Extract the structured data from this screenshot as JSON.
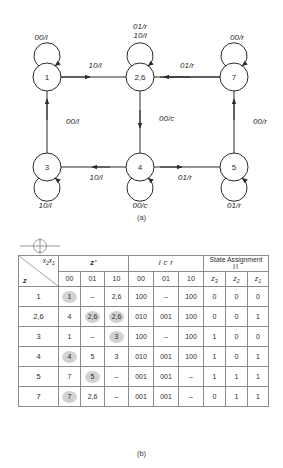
{
  "figure_a": {
    "caption": "(a)",
    "states": [
      {
        "id": "s1",
        "label": "1"
      },
      {
        "id": "s26",
        "label": "2,6"
      },
      {
        "id": "s7",
        "label": "7"
      },
      {
        "id": "s3",
        "label": "3"
      },
      {
        "id": "s4",
        "label": "4"
      },
      {
        "id": "s5",
        "label": "5"
      }
    ],
    "self_loops": [
      {
        "state": "1",
        "label": "00/l",
        "position": "top"
      },
      {
        "state": "2,6",
        "label_line1": "01/r",
        "label_line2": "10/l",
        "position": "top"
      },
      {
        "state": "7",
        "label": "00/r",
        "position": "top"
      },
      {
        "state": "3",
        "label": "10/l",
        "position": "bottom"
      },
      {
        "state": "4",
        "label": "00/c",
        "position": "bottom"
      },
      {
        "state": "5",
        "label": "01/r",
        "position": "bottom"
      }
    ],
    "transitions": [
      {
        "from": "1",
        "to": "2,6",
        "label": "10/l",
        "direction": "right"
      },
      {
        "from": "7",
        "to": "2,6",
        "label": "01/r",
        "direction": "left"
      },
      {
        "from": "3",
        "to": "1",
        "label": "00/l",
        "direction": "up"
      },
      {
        "from": "2,6",
        "to": "4",
        "label": "00/c",
        "direction": "down"
      },
      {
        "from": "5",
        "to": "7",
        "label": "00/r",
        "direction": "up"
      },
      {
        "from": "4",
        "to": "3",
        "label": "10/l",
        "direction": "left"
      },
      {
        "from": "4",
        "to": "5",
        "label": "01/r",
        "direction": "right"
      }
    ]
  },
  "figure_b": {
    "caption": "(b)",
    "corner": {
      "col_var": "x2x1",
      "row_var": "z"
    },
    "group_headers": [
      {
        "label": "z'",
        "span": 3,
        "italic": true
      },
      {
        "label": "l c r",
        "span": 3,
        "italic": true
      },
      {
        "label": "State Assignment",
        "sub": "II",
        "span": 3,
        "italic": false
      }
    ],
    "sub_headers": [
      "00",
      "01",
      "10",
      "00",
      "01",
      "10",
      "z3",
      "z2",
      "z1"
    ],
    "rows": [
      {
        "state": "1",
        "next": [
          "1",
          "–",
          "2,6"
        ],
        "next_circled": [
          true,
          false,
          false
        ],
        "out": [
          "100",
          "–",
          "100"
        ],
        "assign": [
          "0",
          "0",
          "0"
        ]
      },
      {
        "state": "2,6",
        "next": [
          "4",
          "2,6",
          "2,6"
        ],
        "next_circled": [
          false,
          true,
          true
        ],
        "out": [
          "010",
          "001",
          "100"
        ],
        "assign": [
          "0",
          "0",
          "1"
        ]
      },
      {
        "state": "3",
        "next": [
          "1",
          "–",
          "3"
        ],
        "next_circled": [
          false,
          false,
          true
        ],
        "out": [
          "100",
          "–",
          "100"
        ],
        "assign": [
          "1",
          "0",
          "0"
        ]
      },
      {
        "state": "4",
        "next": [
          "4",
          "5",
          "3"
        ],
        "next_circled": [
          true,
          false,
          false
        ],
        "out": [
          "010",
          "001",
          "100"
        ],
        "assign": [
          "1",
          "0",
          "1"
        ]
      },
      {
        "state": "5",
        "next": [
          "7",
          "5",
          "–"
        ],
        "next_circled": [
          false,
          true,
          false
        ],
        "out": [
          "001",
          "001",
          "–"
        ],
        "assign": [
          "1",
          "1",
          "1"
        ]
      },
      {
        "state": "7",
        "next": [
          "7",
          "2,6",
          "–"
        ],
        "next_circled": [
          true,
          false,
          false
        ],
        "out": [
          "001",
          "001",
          "–"
        ],
        "assign": [
          "0",
          "1",
          "1"
        ]
      }
    ]
  },
  "colors": {
    "line": "#2a2a2a",
    "grid": "#8b8b8b",
    "highlight": "#d2d2d2",
    "background": "#ffffff"
  }
}
